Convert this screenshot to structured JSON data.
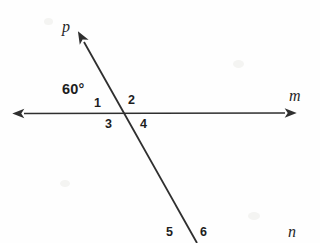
{
  "figure": {
    "type": "geometry-diagram",
    "background_color": "#fefefe",
    "stroke_color": "#2f2f2f",
    "canvas": {
      "width": 320,
      "height": 243
    }
  },
  "lines": [
    {
      "id": "line-m",
      "label": "m",
      "label_x": 289,
      "label_y": 88,
      "x1": 24,
      "y1": 113.5,
      "x2": 285,
      "y2": 113.0,
      "arrow_start": true,
      "arrow_end": true
    },
    {
      "id": "line-p-n",
      "label_top": "p",
      "label_top_x": 62,
      "label_top_y": 19,
      "label_bottom": "n",
      "label_bottom_x": 288,
      "label_bottom_y": 224,
      "x1": 84,
      "y1": 42,
      "x2": 197,
      "y2": 243,
      "arrow_start": true,
      "arrow_end": false
    }
  ],
  "intersection": {
    "x": 123,
    "y": 113
  },
  "angle_labels": [
    {
      "id": "angle-measure-60",
      "text": "60°",
      "x": 62,
      "y": 82,
      "bold": true
    },
    {
      "id": "angle-1",
      "text": "1",
      "x": 94,
      "y": 97,
      "bold": true
    },
    {
      "id": "angle-2",
      "text": "2",
      "x": 128,
      "y": 94,
      "bold": true
    },
    {
      "id": "angle-3",
      "text": "3",
      "x": 105,
      "y": 118,
      "bold": true
    },
    {
      "id": "angle-4",
      "text": "4",
      "x": 140,
      "y": 118,
      "bold": true
    },
    {
      "id": "angle-5",
      "text": "5",
      "x": 166,
      "y": 226,
      "bold": true
    },
    {
      "id": "angle-6",
      "text": "6",
      "x": 200,
      "y": 226,
      "bold": true
    }
  ]
}
